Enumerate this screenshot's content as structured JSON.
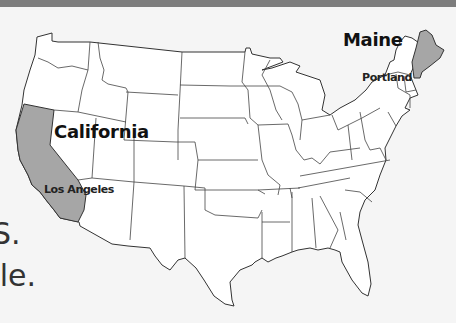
{
  "map": {
    "title": "United States map",
    "highlighted_states": [
      {
        "name": "California",
        "city": "Los Angeles",
        "fill": "#a6a6a6"
      },
      {
        "name": "Maine",
        "city": "Portland",
        "fill": "#a6a6a6"
      }
    ],
    "labels": {
      "california": "California",
      "los_angeles": "Los Angeles",
      "maine": "Maine",
      "portland": "Portland"
    },
    "colors": {
      "background": "#f5f5f5",
      "top_bar": "#7d7d7d",
      "state_fill": "#ffffff",
      "highlight_fill": "#a6a6a6",
      "border": "#333333"
    }
  },
  "side_text": {
    "line1": "S.",
    "line2": "yle."
  }
}
